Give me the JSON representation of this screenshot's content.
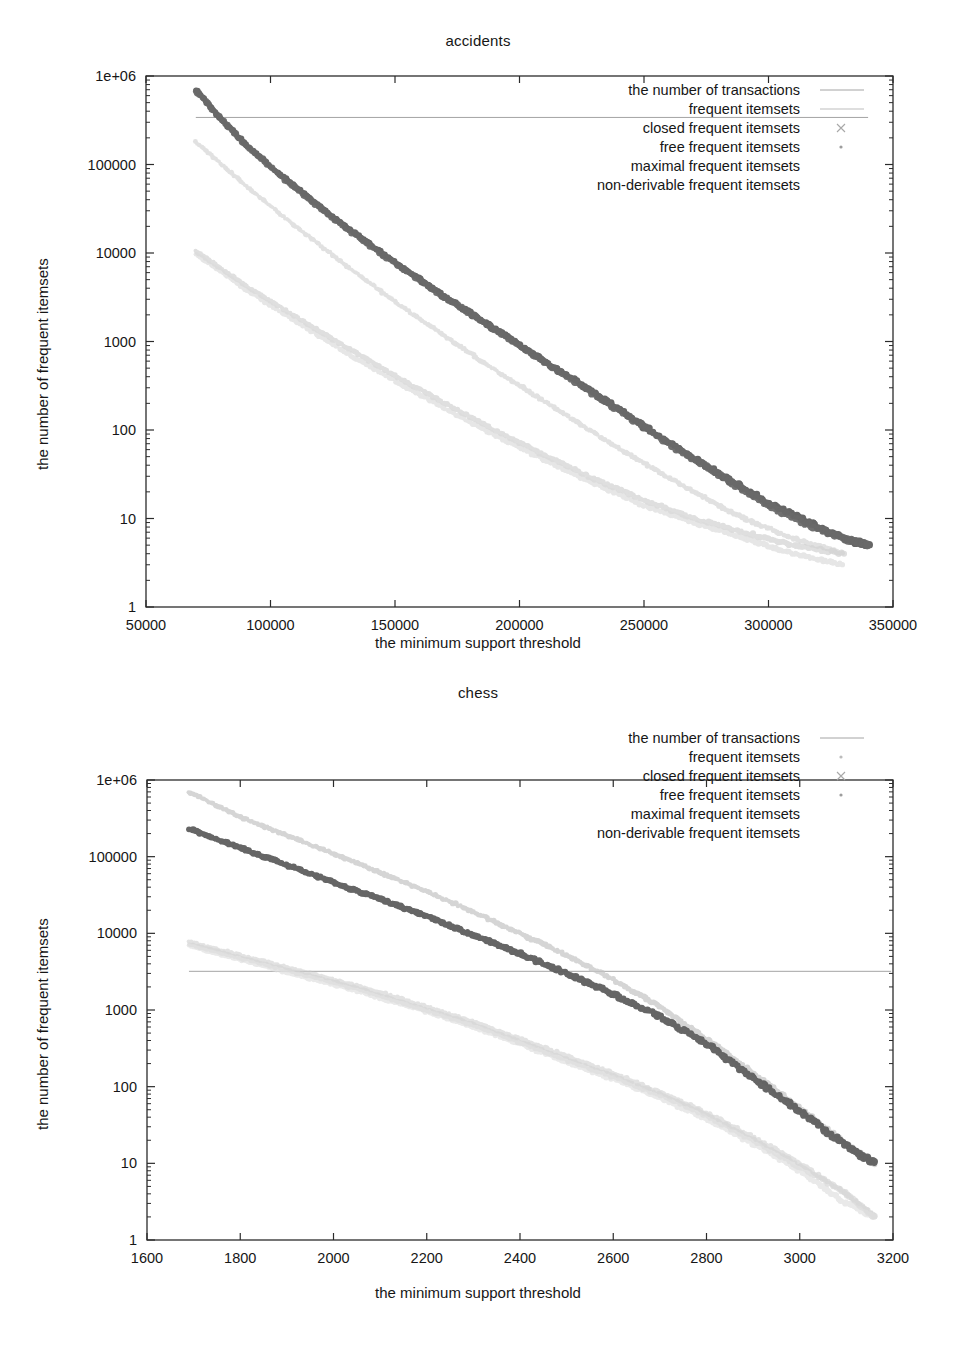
{
  "figures": [
    {
      "id": "accidents",
      "title": "accidents",
      "xlabel": "the minimum support threshold",
      "ylabel": "the number of frequent itemsets",
      "legend": [
        {
          "label": "the number of transactions",
          "marker": "line",
          "color": "#9a9a9a"
        },
        {
          "label": "frequent itemsets",
          "marker": "line",
          "color": "#b5b5b5"
        },
        {
          "label": "closed frequent itemsets",
          "marker": "cross",
          "color": "#a8a8a8"
        },
        {
          "label": "free frequent itemsets",
          "marker": "dot",
          "color": "#9d9d9d"
        },
        {
          "label": "maximal frequent itemsets",
          "marker": "none",
          "color": "#9d9d9d"
        },
        {
          "label": "non-derivable frequent itemsets",
          "marker": "none",
          "color": "#bcbcbc"
        }
      ],
      "xticks": [
        50000,
        100000,
        150000,
        200000,
        250000,
        300000,
        350000
      ],
      "xticklabels": [
        "50000",
        "100000",
        "150000",
        "200000",
        "250000",
        "300000",
        "350000"
      ],
      "yticks": [
        1,
        10,
        100,
        1000,
        10000,
        100000,
        1000000
      ],
      "yticklabels": [
        "1",
        "10",
        "100",
        "1000",
        "10000",
        "100000",
        "1e+06"
      ]
    },
    {
      "id": "chess",
      "title": "chess",
      "xlabel": "the minimum support threshold",
      "ylabel": "the number of frequent itemsets",
      "legend": [
        {
          "label": "the number of transactions",
          "marker": "line",
          "color": "#9a9a9a"
        },
        {
          "label": "frequent itemsets",
          "marker": "dot",
          "color": "#bcbcbc"
        },
        {
          "label": "closed frequent itemsets",
          "marker": "cross",
          "color": "#a8a8a8"
        },
        {
          "label": "free frequent itemsets",
          "marker": "dot",
          "color": "#9d9d9d"
        },
        {
          "label": "maximal frequent itemsets",
          "marker": "none",
          "color": "#9d9d9d"
        },
        {
          "label": "non-derivable frequent itemsets",
          "marker": "none",
          "color": "#bcbcbc"
        }
      ],
      "xticks": [
        1600,
        1800,
        2000,
        2200,
        2400,
        2600,
        2800,
        3000,
        3200
      ],
      "xticklabels": [
        "1600",
        "1800",
        "2000",
        "2200",
        "2400",
        "2600",
        "2800",
        "3000",
        "3200"
      ],
      "yticks": [
        1,
        10,
        100,
        1000,
        10000,
        100000,
        1000000
      ],
      "yticklabels": [
        "1",
        "10",
        "100",
        "1000",
        "10000",
        "100000",
        "1e+06"
      ]
    }
  ],
  "chart_data": [
    {
      "type": "line",
      "id": "accidents",
      "title": "accidents",
      "xlabel": "the minimum support threshold",
      "ylabel": "the number of frequent itemsets",
      "yscale": "log",
      "xlim": [
        50000,
        350000
      ],
      "ylim": [
        1,
        1000000
      ],
      "grid": false,
      "legend_position": "top-right inside",
      "series": [
        {
          "name": "the number of transactions",
          "style": "horizontal-line",
          "color": "#9a9a9a",
          "x": [
            70000,
            340000
          ],
          "values": [
            340183,
            340183
          ]
        },
        {
          "name": "frequent itemsets",
          "style": "points-thick",
          "color": "#5e5e5e",
          "x": [
            70000,
            80000,
            90000,
            100000,
            110000,
            120000,
            130000,
            140000,
            150000,
            160000,
            170000,
            180000,
            190000,
            200000,
            210000,
            220000,
            230000,
            240000,
            250000,
            260000,
            270000,
            280000,
            290000,
            300000,
            310000,
            320000,
            330000,
            340000
          ],
          "values": [
            700000,
            330000,
            170000,
            95000,
            56000,
            33000,
            20000,
            12500,
            7800,
            5000,
            3200,
            2100,
            1400,
            900,
            600,
            400,
            260,
            170,
            110,
            72,
            48,
            32,
            22,
            15,
            11,
            8,
            6,
            5
          ]
        },
        {
          "name": "closed frequent itemsets",
          "style": "points-thick",
          "color": "#6a6a6a",
          "x": [
            70000,
            90000,
            110000,
            130000,
            150000,
            170000,
            190000,
            210000,
            230000,
            250000,
            270000,
            290000,
            310000,
            330000,
            340000
          ],
          "values": [
            680000,
            165000,
            54000,
            19500,
            7600,
            3150,
            1380,
            590,
            255,
            108,
            47,
            21,
            10,
            6,
            5
          ]
        },
        {
          "name": "free frequent itemsets",
          "style": "points-faint",
          "color": "#c9c9c9",
          "x": [
            70000,
            90000,
            110000,
            130000,
            150000,
            170000,
            190000,
            210000,
            230000,
            250000,
            270000,
            290000,
            310000,
            330000
          ],
          "values": [
            180000,
            58000,
            20000,
            7400,
            2800,
            1150,
            480,
            210,
            92,
            42,
            20,
            10,
            6,
            4
          ]
        },
        {
          "name": "maximal frequent itemsets",
          "style": "points-light",
          "color": "#d2d2d2",
          "x": [
            70000,
            90000,
            110000,
            130000,
            150000,
            170000,
            190000,
            210000,
            230000,
            250000,
            270000,
            290000,
            310000,
            330000
          ],
          "values": [
            10500,
            4300,
            1900,
            880,
            410,
            200,
            100,
            52,
            28,
            16,
            10,
            7,
            5,
            4
          ]
        },
        {
          "name": "non-derivable frequent itemsets",
          "style": "points-light",
          "color": "#dcdcdc",
          "x": [
            70000,
            90000,
            110000,
            130000,
            150000,
            170000,
            190000,
            210000,
            230000,
            250000,
            270000,
            290000,
            310000,
            330000
          ],
          "values": [
            9800,
            3900,
            1700,
            760,
            360,
            175,
            88,
            46,
            25,
            14,
            9,
            6,
            4,
            3
          ]
        }
      ]
    },
    {
      "type": "line",
      "id": "chess",
      "title": "chess",
      "xlabel": "the minimum support threshold",
      "ylabel": "the number of frequent itemsets",
      "yscale": "log",
      "xlim": [
        1600,
        3200
      ],
      "ylim": [
        1,
        1000000
      ],
      "grid": false,
      "legend_position": "top-right inside",
      "series": [
        {
          "name": "the number of transactions",
          "style": "horizontal-line",
          "color": "#9a9a9a",
          "x": [
            1690,
            3196
          ],
          "values": [
            3196,
            3196
          ]
        },
        {
          "name": "frequent itemsets",
          "style": "points-light",
          "color": "#c4c4c4",
          "x": [
            1690,
            1800,
            1900,
            2000,
            2100,
            2200,
            2300,
            2400,
            2500,
            2600,
            2700,
            2800,
            2900,
            3000,
            3100,
            3160
          ],
          "values": [
            700000,
            330000,
            190000,
            110000,
            62000,
            35000,
            19000,
            10000,
            5200,
            2500,
            1100,
            420,
            150,
            52,
            18,
            10
          ]
        },
        {
          "name": "closed frequent itemsets",
          "style": "points-thick",
          "color": "#5e5e5e",
          "x": [
            1690,
            1800,
            1900,
            2000,
            2100,
            2200,
            2300,
            2400,
            2500,
            2600,
            2700,
            2800,
            2900,
            3000,
            3100,
            3160
          ],
          "values": [
            230000,
            130000,
            78000,
            46000,
            28000,
            16500,
            9500,
            5400,
            3000,
            1600,
            820,
            360,
            130,
            48,
            17,
            10
          ]
        },
        {
          "name": "free frequent itemsets",
          "style": "points-faint",
          "color": "#cccccc",
          "x": [
            1690,
            1800,
            1900,
            2000,
            2100,
            2200,
            2300,
            2400,
            2500,
            2600,
            2700,
            2800,
            2900,
            3000,
            3100,
            3160
          ],
          "values": [
            7800,
            5200,
            3600,
            2500,
            1700,
            1100,
            700,
            420,
            250,
            150,
            85,
            45,
            22,
            10,
            4,
            2
          ]
        },
        {
          "name": "maximal frequent itemsets",
          "style": "points-light",
          "color": "#d6d6d6",
          "x": [
            1690,
            1800,
            1900,
            2000,
            2100,
            2200,
            2300,
            2400,
            2500,
            2600,
            2700,
            2800,
            2900,
            3000,
            3100,
            3160
          ],
          "values": [
            7200,
            4800,
            3300,
            2300,
            1550,
            1000,
            640,
            380,
            225,
            135,
            78,
            42,
            20,
            9,
            4,
            2
          ]
        },
        {
          "name": "non-derivable frequent itemsets",
          "style": "points-light",
          "color": "#e0e0e0",
          "x": [
            1690,
            1800,
            1900,
            2000,
            2100,
            2200,
            2300,
            2400,
            2500,
            2600,
            2700,
            2800,
            2900,
            3000,
            3100,
            3160
          ],
          "values": [
            6900,
            4500,
            3100,
            2150,
            1450,
            950,
            600,
            360,
            210,
            126,
            72,
            38,
            18,
            8,
            3,
            2
          ]
        }
      ]
    }
  ]
}
